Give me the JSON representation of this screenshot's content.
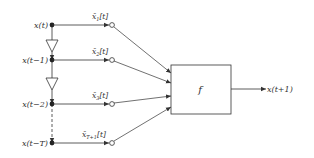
{
  "diagram": {
    "type": "time-delay neural predictor block diagram",
    "inputs": [
      {
        "label": "x(t)",
        "tap_label": "x̄",
        "tap_sub": "1",
        "tap_suffix": "[t]",
        "y": 25
      },
      {
        "label": "x(t−1)",
        "tap_label": "x̄",
        "tap_sub": "2",
        "tap_suffix": "[t]",
        "y": 60
      },
      {
        "label": "x(t−2)",
        "tap_label": "x̄",
        "tap_sub": "3",
        "tap_suffix": "[t]",
        "y": 104
      },
      {
        "label": "x(t−T)",
        "tap_label": "x̄",
        "tap_sub": "T+1",
        "tap_suffix": "[t]",
        "y": 143
      }
    ],
    "delay_elements": [
      {
        "name": "delay-1",
        "from": "x(t)",
        "to": "x(t−1)"
      },
      {
        "name": "delay-2",
        "from": "x(t−1)",
        "to": "x(t−2)"
      }
    ],
    "function_block": {
      "label": "f"
    },
    "output": {
      "label": "x(t+1)"
    },
    "colors": {
      "stroke": "#333333",
      "background": "#ffffff"
    }
  }
}
